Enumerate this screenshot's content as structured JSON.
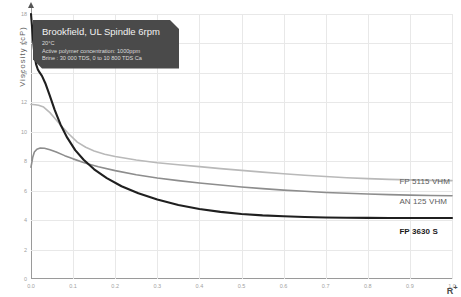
{
  "chart_data": {
    "type": "line",
    "title": "",
    "xlabel": "R+",
    "ylabel": "Viscosity (cP)",
    "xlim": [
      0.0,
      1.0
    ],
    "ylim": [
      0,
      18
    ],
    "grid": true,
    "legend_position": "right-inline",
    "xticks": [
      "0.0",
      "0.1",
      "0.2",
      "0.3",
      "0.4",
      "0.5",
      "0.6",
      "0.7",
      "0.8",
      "0.9",
      "1.0"
    ],
    "xtick_values": [
      0.0,
      0.1,
      0.2,
      0.3,
      0.4,
      0.5,
      0.6,
      0.7,
      0.8,
      0.9,
      1.0
    ],
    "yticks": [
      "0",
      "2",
      "4",
      "6",
      "8",
      "10",
      "12",
      "14",
      "16",
      "18"
    ],
    "ytick_values": [
      0,
      2,
      4,
      6,
      8,
      10,
      12,
      14,
      16,
      18
    ],
    "series": [
      {
        "name": "FP 5115 VHM",
        "color": "#b9b9b9",
        "width": 1.6,
        "label_x": 0.875,
        "label_y": 6.9,
        "x": [
          0.0,
          0.004,
          0.01,
          0.018,
          0.03,
          0.045,
          0.06,
          0.075,
          0.09,
          0.11,
          0.13,
          0.15,
          0.175,
          0.2,
          0.25,
          0.3,
          0.35,
          0.4,
          0.45,
          0.5,
          0.55,
          0.6,
          0.65,
          0.7,
          0.75,
          0.8,
          0.85,
          0.9,
          0.95,
          1.0
        ],
        "y": [
          11.85,
          11.85,
          11.84,
          11.8,
          11.68,
          11.3,
          10.8,
          10.3,
          9.85,
          9.3,
          8.95,
          8.7,
          8.48,
          8.32,
          8.08,
          7.9,
          7.76,
          7.63,
          7.5,
          7.38,
          7.26,
          7.15,
          7.05,
          6.96,
          6.88,
          6.82,
          6.77,
          6.73,
          6.7,
          6.68
        ]
      },
      {
        "name": "AN 125 VHM",
        "color": "#8d8d8d",
        "width": 1.6,
        "label_x": 0.875,
        "label_y": 5.55,
        "x": [
          0.0,
          0.004,
          0.008,
          0.014,
          0.022,
          0.032,
          0.045,
          0.06,
          0.08,
          0.1,
          0.13,
          0.16,
          0.2,
          0.25,
          0.3,
          0.35,
          0.4,
          0.45,
          0.5,
          0.55,
          0.6,
          0.65,
          0.7,
          0.75,
          0.8,
          0.85,
          0.9,
          0.95,
          1.0
        ],
        "y": [
          7.6,
          8.25,
          8.62,
          8.82,
          8.9,
          8.88,
          8.78,
          8.62,
          8.38,
          8.16,
          7.86,
          7.62,
          7.36,
          7.08,
          6.86,
          6.68,
          6.52,
          6.38,
          6.25,
          6.14,
          6.04,
          5.96,
          5.88,
          5.82,
          5.77,
          5.73,
          5.7,
          5.67,
          5.65
        ]
      },
      {
        "name": "FP 3630 S",
        "color": "#1f1f1f",
        "width": 2.1,
        "emphasis": true,
        "label_x": 0.875,
        "label_y": 3.55,
        "x": [
          0.0,
          0.002,
          0.005,
          0.008,
          0.012,
          0.016,
          0.02,
          0.026,
          0.034,
          0.044,
          0.056,
          0.07,
          0.086,
          0.105,
          0.125,
          0.15,
          0.18,
          0.215,
          0.255,
          0.3,
          0.35,
          0.4,
          0.45,
          0.5,
          0.55,
          0.6,
          0.65,
          0.7,
          0.75,
          0.8,
          0.85,
          0.9,
          0.95,
          1.0
        ],
        "y": [
          18.0,
          17.3,
          16.2,
          15.3,
          14.6,
          14.25,
          14.05,
          13.8,
          13.3,
          12.5,
          11.5,
          10.5,
          9.6,
          8.75,
          8.1,
          7.45,
          6.85,
          6.3,
          5.82,
          5.4,
          5.02,
          4.75,
          4.56,
          4.42,
          4.32,
          4.26,
          4.21,
          4.18,
          4.16,
          4.15,
          4.14,
          4.14,
          4.14,
          4.14
        ]
      }
    ]
  },
  "annotation": {
    "headline": "Brookfield, UL Spindle 6rpm",
    "line1": "20°C",
    "line2": "Active polymer concentration: 1000ppm",
    "line3": "Brine : 30 000 TDS, 0 to 10 800 TDS Ca",
    "background": "#4a4a4a"
  }
}
